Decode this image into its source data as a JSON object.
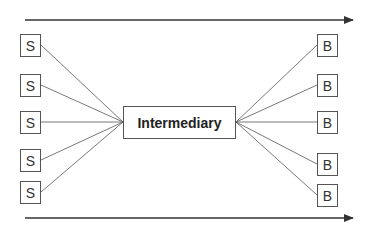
{
  "diagram": {
    "type": "hub-and-spoke",
    "center": {
      "label": "Intermediary"
    },
    "sellers": [
      {
        "label": "S",
        "y": 45
      },
      {
        "label": "S",
        "y": 85
      },
      {
        "label": "S",
        "y": 122
      },
      {
        "label": "S",
        "y": 160
      },
      {
        "label": "S",
        "y": 192
      }
    ],
    "buyers": [
      {
        "label": "B",
        "y": 45
      },
      {
        "label": "B",
        "y": 85
      },
      {
        "label": "B",
        "y": 122
      },
      {
        "label": "B",
        "y": 164
      },
      {
        "label": "B",
        "y": 195
      }
    ],
    "arrows": [
      {
        "name": "top-arrow",
        "y": 20,
        "direction": "right"
      },
      {
        "name": "bottom-arrow",
        "y": 218,
        "direction": "right"
      }
    ],
    "colors": {
      "line": "#555555",
      "arrow": "#333333",
      "text": "#333333"
    }
  }
}
